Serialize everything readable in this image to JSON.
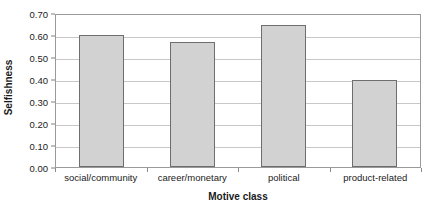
{
  "chart_data": {
    "type": "bar",
    "title": "",
    "subtitle": "",
    "xlabel": "Motive class",
    "ylabel": "Selfishness",
    "categories": [
      "social/community",
      "career/monetary",
      "political",
      "product-related"
    ],
    "values": [
      0.6,
      0.57,
      0.645,
      0.395
    ],
    "series": [
      {
        "name": "Selfishness",
        "values": [
          0.6,
          0.57,
          0.645,
          0.395
        ]
      }
    ],
    "ylim": [
      0.0,
      0.7
    ],
    "ytick_labels": [
      "0.70",
      "0.60",
      "0.50",
      "0.40",
      "0.30",
      "0.20",
      "0.10",
      "0.00"
    ],
    "ytick_values": [
      0.7,
      0.6,
      0.5,
      0.4,
      0.3,
      0.2,
      0.1,
      0.0
    ],
    "ytick_step": 0.1,
    "xlim_categories": 4,
    "grid": {
      "horizontal": true,
      "vertical": false
    },
    "legend": {
      "visible": false,
      "position": "none",
      "entries": []
    },
    "annotations": [],
    "colors": {
      "bar_fill": "#d2d2d2",
      "bar_border": "#6e6e6e",
      "gridline": "#c8c8c8",
      "axis_line": "#9a9a9a",
      "tick_mark": "#808080",
      "text": "#1a1a1a",
      "background": "#ffffff"
    }
  }
}
